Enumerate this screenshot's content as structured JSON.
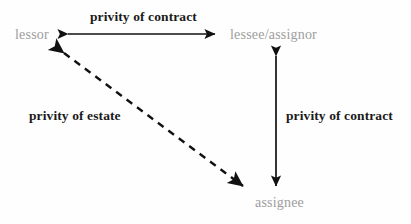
{
  "diagram": {
    "background_color": "#fefefe",
    "node_color": "#9d9d9d",
    "edge_color": "#1a1a1a",
    "nodes": [
      {
        "id": "lessor",
        "label": "lessor"
      },
      {
        "id": "lessee",
        "label": "lessee/assignor"
      },
      {
        "id": "assignee",
        "label": "assignee"
      }
    ],
    "edges": [
      {
        "id": "lessor-lessee",
        "label": "privity of contract",
        "style": "solid",
        "heads": "double",
        "from": "lessor",
        "to": "lessee"
      },
      {
        "id": "lessee-assignee",
        "label": "privity of contract",
        "style": "solid",
        "heads": "double",
        "from": "lessee",
        "to": "assignee"
      },
      {
        "id": "lessor-assignee",
        "label": "privity of estate",
        "style": "dashed",
        "heads": "double",
        "from": "lessor",
        "to": "assignee"
      }
    ]
  }
}
